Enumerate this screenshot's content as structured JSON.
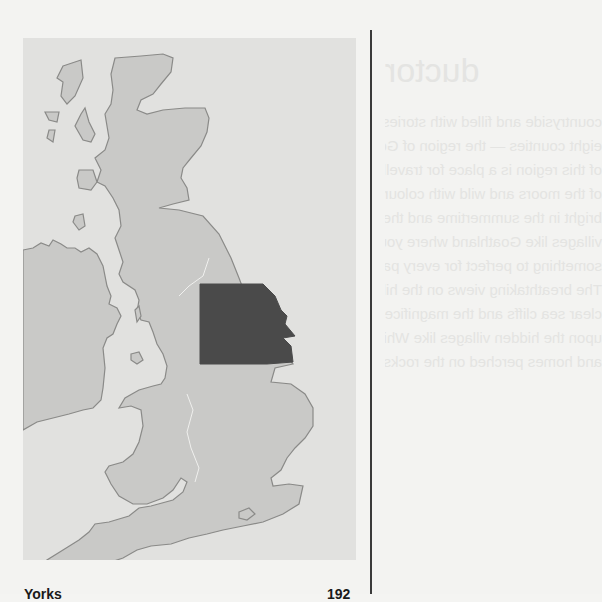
{
  "map": {
    "title": "Map of Great Britain highlighting Yorkshire",
    "highlighted_region": "Yorkshire",
    "colors": {
      "frame_background": "#e1e1df",
      "land": "#c9c9c7",
      "coastline": "#8a8a88",
      "highlight": "#4a4a4a",
      "border_line": "#f0f0ee"
    }
  },
  "captions": {
    "left": "Yorks",
    "right": "192"
  },
  "bleed_through": {
    "heading": "ductor",
    "lines": [
      "countryside and filled with stories of quiet moments and",
      "eight counties — the region of God's Own Country",
      "of this region is a place for travellers to wander in",
      "of the moors and wild with colour in late summer",
      "bright in the summertime and the towns along the",
      "villages like Goathland where you can walk",
      "something to perfect for every passenger in this",
      "The breathtaking views on the hills remind",
      "clear sea cliffs and the magnificent coast to the",
      "upon the hidden villages like Whitby and its",
      "and homes perched on the rocks like Robin"
    ]
  }
}
